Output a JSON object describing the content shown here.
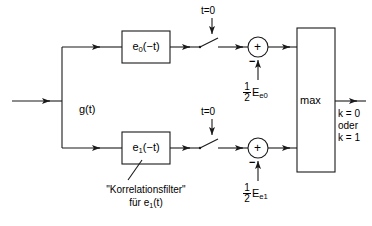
{
  "figure": {
    "type": "block-diagram",
    "stroke_color": "#1a1a1a",
    "background_color": "#ffffff"
  },
  "input": {
    "label": "g(t)",
    "name": "input-signal"
  },
  "branches": [
    {
      "id": "upper",
      "filter_label_base": "e",
      "filter_label_sub": "0",
      "filter_label_tail": "(−t)",
      "switch_label": "t=0",
      "sum_symbol": "+",
      "sum_minus": "−",
      "energy_num": "1",
      "energy_den": "2",
      "energy_symbol": "E",
      "energy_sub": "e0"
    },
    {
      "id": "lower",
      "filter_label_base": "e",
      "filter_label_sub": "1",
      "filter_label_tail": "(−t)",
      "switch_label": "t=0",
      "sum_symbol": "+",
      "sum_minus": "−",
      "energy_num": "1",
      "energy_den": "2",
      "energy_symbol": "E",
      "energy_sub": "e1"
    }
  ],
  "annotation": {
    "line1": "\"Korrelationsfilter\"",
    "line2_prefix": "für e",
    "line2_sub": "1",
    "line2_tail": "(t)"
  },
  "decision": {
    "label": "max",
    "output_line1": "k = 0",
    "output_line2": "oder",
    "output_line3": "k = 1"
  }
}
